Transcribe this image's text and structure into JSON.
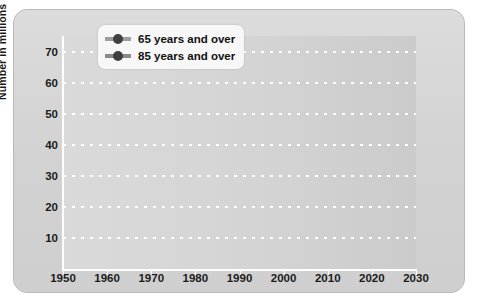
{
  "chart_data": {
    "type": "line",
    "title": "",
    "subtitle": "",
    "xlabel": "",
    "ylabel": "Number in millions",
    "categories": [
      "1950",
      "1960",
      "1970",
      "1980",
      "1990",
      "2000",
      "2010",
      "2020",
      "2030"
    ],
    "x": [
      1950,
      1960,
      1970,
      1980,
      1990,
      2000,
      2010,
      2020,
      2030
    ],
    "xlim": [
      1950,
      2030
    ],
    "ylim": [
      0,
      75
    ],
    "yticks": [
      "10",
      "20",
      "30",
      "40",
      "50",
      "60",
      "70"
    ],
    "ytick_values": [
      10,
      20,
      30,
      40,
      50,
      60,
      70
    ],
    "grid": "horizontal-dotted-white",
    "legend_position": "top-center",
    "series": [
      {
        "name": "65 years and over",
        "color": "#4a4a4a",
        "fill": "#c6c6c6",
        "values": [
          12.5,
          16.5,
          20.0,
          25.5,
          31.0,
          34.5,
          40.0,
          52.5,
          69.5
        ]
      },
      {
        "name": "85 years and over",
        "color": "#4a4a4a",
        "fill": "#a8a8a8",
        "values": [
          0.6,
          1.0,
          1.5,
          2.3,
          3.1,
          4.3,
          5.7,
          6.5,
          8.3
        ]
      }
    ],
    "annotations": []
  },
  "legend": {
    "items": [
      {
        "label": "65 years and over",
        "marker": "circle-line-marker",
        "swatch": "#9d9d9d",
        "dot": "#3f3f3f"
      },
      {
        "label": "85 years and over",
        "marker": "circle-line-marker",
        "swatch": "#8a8a8a",
        "dot": "#3f3f3f"
      }
    ]
  },
  "axes": {
    "y_title": "Number in millions"
  },
  "colors": {
    "panel_background": "#d3d3d3",
    "plot_background": "#d6d6d6",
    "gridline": "#ffffff",
    "line": "#4a4a4a",
    "marker": "#3a3a3a",
    "area_65": "#c6c6c6",
    "area_85": "#a8a8a8",
    "text": "#1b1b1b"
  }
}
